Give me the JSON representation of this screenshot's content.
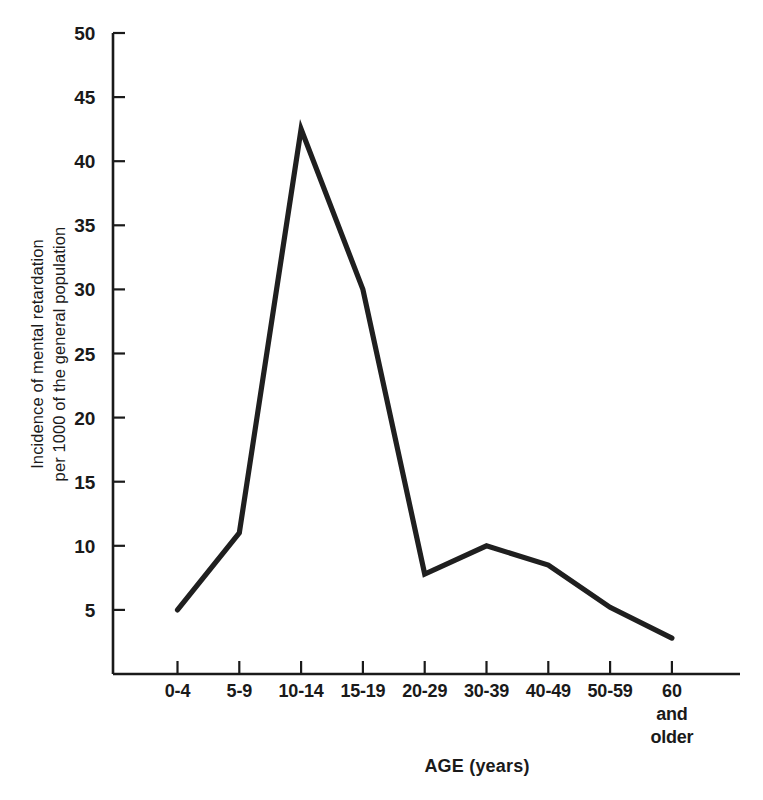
{
  "chart_data": {
    "type": "line",
    "title": "",
    "xlabel": "AGE (years)",
    "ylabel": "Incidence of mental retardation per 1000 of the general population",
    "ylabel_lines": [
      "Incidence of mental retardation",
      "per 1000 of the general population"
    ],
    "categories": [
      "0-4",
      "5-9",
      "10-14",
      "15-19",
      "20-29",
      "30-39",
      "40-49",
      "50-59",
      "60 and older"
    ],
    "category_labels": [
      {
        "lines": [
          "0-4"
        ]
      },
      {
        "lines": [
          "5-9"
        ]
      },
      {
        "lines": [
          "10-14"
        ]
      },
      {
        "lines": [
          "15-19"
        ]
      },
      {
        "lines": [
          "20-29"
        ]
      },
      {
        "lines": [
          "30-39"
        ]
      },
      {
        "lines": [
          "40-49"
        ]
      },
      {
        "lines": [
          "50-59"
        ]
      },
      {
        "lines": [
          "60",
          "and",
          "older"
        ]
      }
    ],
    "values": [
      5.0,
      11.0,
      42.5,
      30.0,
      7.8,
      10.0,
      8.5,
      5.2,
      2.8
    ],
    "ylim": [
      0,
      50
    ],
    "yticks": [
      5,
      10,
      15,
      20,
      25,
      30,
      35,
      40,
      45,
      50
    ],
    "ytick_labels": [
      "5",
      "10",
      "15",
      "20",
      "25",
      "30",
      "35",
      "40",
      "45",
      "50"
    ],
    "grid": false,
    "legend": null,
    "legend_position": "none",
    "series_color": "#1f1f1f",
    "axis_color": "#1a1a1a",
    "background_color": "#ffffff"
  },
  "figure": {
    "width": 763,
    "height": 800
  }
}
